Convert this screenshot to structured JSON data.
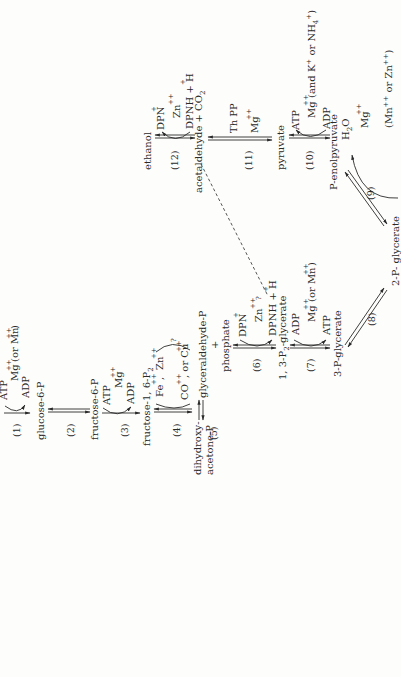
{
  "diagram": {
    "orientation": "rotated 90 degrees counter-clockwise",
    "metabolites": {
      "glucose_6_p": "glucose-6-P",
      "fructose_6_p": "fructose-6-P",
      "fructose_1_6_p2": "fructose-1, 6-P",
      "fructose_1_6_p2_sub": "2",
      "dihydroxy": "dihydroxy-",
      "acetone_p": "acetone-P",
      "glyceraldehyde_p": "glyceraldehyde-P",
      "plus": "+",
      "phosphate": "phosphate",
      "p2_glycerate_pre": "1, 3-P",
      "p2_glycerate_sub": "2",
      "p2_glycerate_post": "-glycerate",
      "three_p_glycerate": "3-P-glycerate",
      "two_p_glycerate": "2-P- glycerate",
      "p_enolpyruvate": "P-enolpyruvate",
      "pyruvate": "pyruvate",
      "acetaldehyde_co2": "acetaldehyde + CO",
      "co2_sub": "2",
      "ethanol": "ethanol",
      "h2o": "H",
      "h2o_sub": "2",
      "h2o_o": "O"
    },
    "steps": [
      {
        "id": "1",
        "label": "(1)",
        "cofactors_in": "ATP",
        "cofactors_out": "ADP",
        "metal": "Mg",
        "metal_charge": "++",
        "alt": "(or Mn",
        "alt_charge": "++",
        "alt_close": ")"
      },
      {
        "id": "2",
        "label": "(2)"
      },
      {
        "id": "3",
        "label": "(3)",
        "cofactors_in": "ATP",
        "cofactors_out": "ADP",
        "metal": "Mg",
        "metal_charge": "++"
      },
      {
        "id": "4",
        "label": "(4)",
        "metal_a": "Fe",
        "metal_a_charge": "++",
        "comma": ",",
        "metal_b": "Zn",
        "metal_b_charge": "++",
        "metal_c": "CO",
        "metal_c_charge": "++",
        "or_cu": ", or Cu",
        "cu_charge": "++",
        "question": "?"
      },
      {
        "id": "5",
        "label": "(5)"
      },
      {
        "id": "6",
        "label": "(6)",
        "cofactors_in": "DPN",
        "in_charge": "+",
        "cofactors_out": "DPNH + H",
        "out_charge": "+",
        "metal": "Zn",
        "metal_charge": "++",
        "question": "?"
      },
      {
        "id": "7",
        "label": "(7)",
        "cofactors_in": "ADP",
        "cofactors_out": "ATP",
        "metal": "Mg",
        "metal_charge": "++",
        "alt": "(or Mn",
        "alt_charge": "++",
        "alt_close": ")"
      },
      {
        "id": "8",
        "label": "(8)"
      },
      {
        "id": "9",
        "label": "(9)",
        "metal": "Mg",
        "metal_charge": "++",
        "alt": "(Mn",
        "alt_charge": "++",
        "alt_mid": " or Zn",
        "alt_mid_charge": "++",
        "alt_close": ")"
      },
      {
        "id": "10",
        "label": "(10)",
        "cofactors_in": "ADP",
        "cofactors_out": "ATP",
        "metal": "Mg",
        "metal_charge": "++",
        "alt": "(and K",
        "alt_charge": "+",
        "alt_mid": " or NH",
        "alt_mid_sub": "4",
        "alt_mid_charge": "+",
        "alt_close": ")"
      },
      {
        "id": "11",
        "label": "(11)",
        "cofactor": "Th PP",
        "metal": "Mg",
        "metal_charge": "++"
      },
      {
        "id": "12",
        "label": "(12)",
        "cofactors_in": "DPNH + H",
        "in_charge": "+",
        "cofactors_out": "DPN",
        "out_charge": "+",
        "metal": "Zn",
        "metal_charge": "++"
      }
    ],
    "top_cut_label": "ATP"
  }
}
